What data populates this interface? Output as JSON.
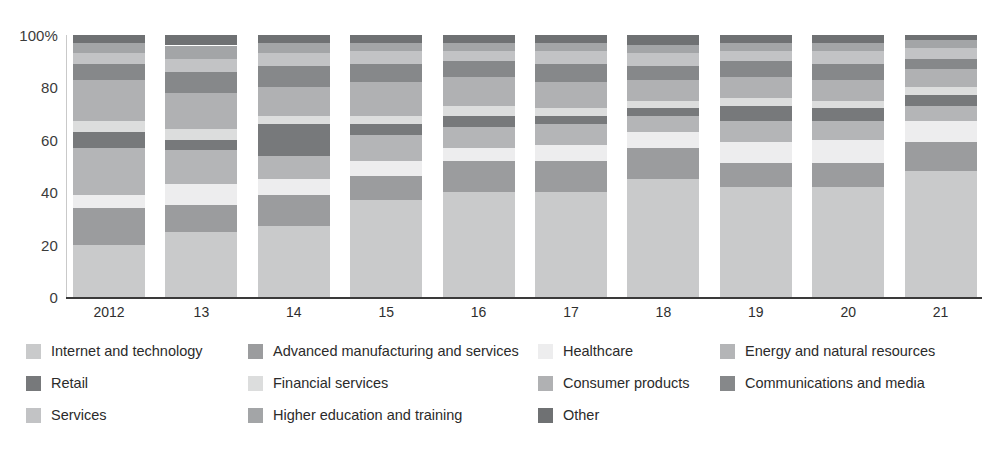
{
  "chart_data": {
    "type": "bar",
    "subtype": "stacked-percentage",
    "title": "",
    "subtitle": "",
    "xlabel": "",
    "ylabel": "",
    "ylim": [
      0,
      100
    ],
    "y_unit": "%",
    "grid": false,
    "legend_position": "bottom",
    "orientation": "vertical",
    "categories": [
      "2012",
      "13",
      "14",
      "15",
      "16",
      "17",
      "18",
      "19",
      "20",
      "21"
    ],
    "y_ticks": [
      {
        "value": 100,
        "label": "100%"
      },
      {
        "value": 80,
        "label": "80"
      },
      {
        "value": 60,
        "label": "60"
      },
      {
        "value": 40,
        "label": "40"
      },
      {
        "value": 20,
        "label": "20"
      },
      {
        "value": 0,
        "label": "0"
      }
    ],
    "series": [
      {
        "name": "Internet and technology",
        "color": "#c9cacb",
        "values": [
          20,
          25,
          27,
          37,
          40,
          40,
          45,
          42,
          42,
          48
        ]
      },
      {
        "name": "Advanced manufacturing and services",
        "color": "#9b9c9e",
        "values": [
          14,
          10,
          12,
          9,
          12,
          12,
          12,
          9,
          9,
          11
        ]
      },
      {
        "name": "Healthcare",
        "color": "#ededee",
        "values": [
          5,
          8,
          6,
          6,
          5,
          6,
          6,
          8,
          9,
          8
        ]
      },
      {
        "name": "Energy and natural resources",
        "color": "#b4b5b7",
        "values": [
          18,
          13,
          9,
          10,
          8,
          8,
          6,
          8,
          7,
          6
        ]
      },
      {
        "name": "Retail",
        "color": "#77797b",
        "values": [
          6,
          4,
          12,
          4,
          4,
          3,
          3,
          6,
          5,
          4
        ]
      },
      {
        "name": "Financial services",
        "color": "#dcdddd",
        "values": [
          4,
          4,
          3,
          3,
          4,
          3,
          3,
          3,
          3,
          3
        ]
      },
      {
        "name": "Consumer products",
        "color": "#b0b1b3",
        "values": [
          16,
          14,
          11,
          13,
          11,
          10,
          8,
          8,
          8,
          7
        ]
      },
      {
        "name": "Communications and media",
        "color": "#86888a",
        "values": [
          6,
          8,
          8,
          7,
          6,
          7,
          5,
          6,
          6,
          4
        ]
      },
      {
        "name": "Services",
        "color": "#c2c3c5",
        "values": [
          4,
          5,
          5,
          5,
          4,
          5,
          5,
          4,
          5,
          4
        ]
      },
      {
        "name": "Higher education and training",
        "color": "#a3a5a7",
        "values": [
          4,
          5,
          4,
          3,
          3,
          3,
          3,
          3,
          3,
          3
        ]
      },
      {
        "name": "Other",
        "color": "#6f7173",
        "values": [
          3,
          4,
          3,
          3,
          3,
          3,
          4,
          3,
          3,
          2
        ]
      }
    ]
  },
  "axis": {
    "y_label_100": "100%",
    "y_label_80": "80",
    "y_label_60": "60",
    "y_label_40": "40",
    "y_label_20": "20",
    "y_label_0": "0"
  },
  "legend": {
    "rows": [
      [
        {
          "label": "Internet and technology",
          "color": "#c9cacb",
          "swatch_name": "legend-swatch-internet-and-technology"
        },
        {
          "label": "Advanced manufacturing and services",
          "color": "#9b9c9e",
          "swatch_name": "legend-swatch-advanced-manufacturing-and-services"
        },
        {
          "label": "Healthcare",
          "color": "#ededee",
          "swatch_name": "legend-swatch-healthcare"
        },
        {
          "label": "Energy and natural resources",
          "color": "#b4b5b7",
          "swatch_name": "legend-swatch-energy-and-natural-resources"
        }
      ],
      [
        {
          "label": "Retail",
          "color": "#77797b",
          "swatch_name": "legend-swatch-retail"
        },
        {
          "label": "Financial services",
          "color": "#dcdddd",
          "swatch_name": "legend-swatch-financial-services"
        },
        {
          "label": "Consumer products",
          "color": "#b0b1b3",
          "swatch_name": "legend-swatch-consumer-products"
        },
        {
          "label": "Communications and media",
          "color": "#86888a",
          "swatch_name": "legend-swatch-communications-and-media"
        }
      ],
      [
        {
          "label": "Services",
          "color": "#c2c3c5",
          "swatch_name": "legend-swatch-services"
        },
        {
          "label": "Higher education and training",
          "color": "#a3a5a7",
          "swatch_name": "legend-swatch-higher-education-and-training"
        },
        {
          "label": "Other",
          "color": "#6f7173",
          "swatch_name": "legend-swatch-other"
        }
      ]
    ]
  }
}
